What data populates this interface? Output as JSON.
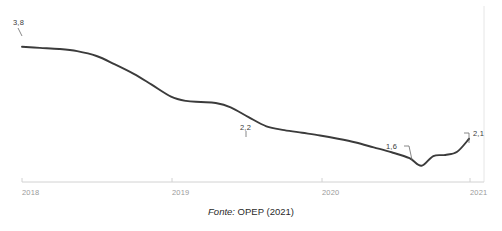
{
  "chart_data": {
    "type": "line",
    "title": "",
    "subtitle": "",
    "xlabel": "",
    "ylabel": "",
    "grid": false,
    "legend": null,
    "xlim": [
      2018,
      2021.1
    ],
    "ylim": [
      1.3,
      4.0
    ],
    "x_tick_labels": [
      "2018",
      "2019",
      "2020",
      "2021"
    ],
    "x_tick_values": [
      2018,
      2019,
      2020,
      2021
    ],
    "series": [
      {
        "name": "OPEP",
        "color": "#3b3b3b",
        "x": [
          2018.0,
          2018.12,
          2018.25,
          2018.37,
          2018.5,
          2018.62,
          2018.75,
          2018.87,
          2019.0,
          2019.1,
          2019.2,
          2019.3,
          2019.4,
          2019.52,
          2019.64,
          2019.76,
          2019.88,
          2020.0,
          2020.12,
          2020.24,
          2020.36,
          2020.48,
          2020.6,
          2020.68,
          2020.76,
          2020.84,
          2020.92,
          2021.0
        ],
        "values": [
          3.8,
          3.78,
          3.76,
          3.72,
          3.63,
          3.48,
          3.3,
          3.1,
          2.88,
          2.8,
          2.78,
          2.76,
          2.68,
          2.5,
          2.33,
          2.26,
          2.21,
          2.16,
          2.1,
          2.03,
          1.94,
          1.85,
          1.74,
          1.6,
          1.78,
          1.8,
          1.86,
          2.1
        ]
      }
    ],
    "point_labels": [
      {
        "name": "start",
        "text": "3,8",
        "value": 3.8,
        "x": 2018.0
      },
      {
        "name": "mid-2019",
        "text": "2,2",
        "value": 2.2,
        "x": 2019.76
      },
      {
        "name": "trough",
        "text": "1,6",
        "value": 1.6,
        "x": 2020.68
      },
      {
        "name": "end",
        "text": "2,1",
        "value": 2.1,
        "x": 2021.0
      }
    ]
  },
  "caption": {
    "source_word": "Fonte:",
    "source_rest": " OPEP (2021)"
  },
  "colors": {
    "line": "#3b3b3b",
    "axis": "#cfcfcf",
    "gridline": "#e4e4e4",
    "tick_text": "#9a9a9a",
    "label_text": "#3a3a3a",
    "background": "#ffffff"
  }
}
